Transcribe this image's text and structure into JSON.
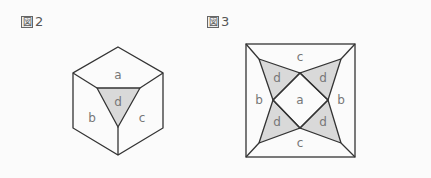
{
  "figures": [
    {
      "id": "fig2",
      "label_kanji": "図",
      "label_number": "2",
      "shape": "hexagon",
      "regions": {
        "a": "a",
        "b": "b",
        "c": "c",
        "d": "d"
      }
    },
    {
      "id": "fig3",
      "label_kanji": "図",
      "label_number": "3",
      "shape": "square",
      "regions": {
        "c_top": "c",
        "c_bottom": "c",
        "b_left": "b",
        "b_right": "b",
        "a_center": "a",
        "d_tl": "d",
        "d_tr": "d",
        "d_bl": "d",
        "d_br": "d"
      }
    }
  ],
  "colors": {
    "stroke": "#333333",
    "shaded": "#d9d9d9",
    "label": "#777777",
    "background": "#fbfbfb"
  }
}
